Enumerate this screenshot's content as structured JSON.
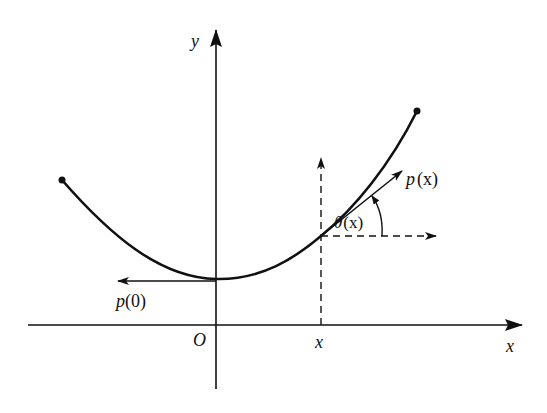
{
  "diagram": {
    "type": "curve-with-tangent",
    "colors": {
      "ink": "#111111",
      "background": "#ffffff"
    },
    "axes": {
      "x_label": "x",
      "y_label": "y",
      "origin_label": "O"
    },
    "marks": {
      "x_tick_label": "x"
    },
    "vectors": {
      "p0_label_fn": "p",
      "p0_label_arg": "(0)",
      "px_label_fn": "p",
      "px_label_arg": "(x)"
    },
    "angle": {
      "label_sym": "θ",
      "label_arg": "(x)"
    }
  }
}
